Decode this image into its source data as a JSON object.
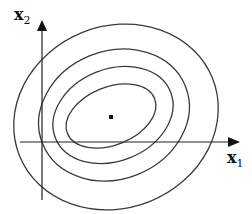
{
  "diagram": {
    "type": "contour-ellipses",
    "axes": {
      "x": {
        "label": "x",
        "subscript": "1"
      },
      "y": {
        "label": "x",
        "subscript": "2"
      }
    },
    "center_point": {
      "x": 111,
      "y": 117
    },
    "ellipses": [
      {
        "name": "contour-outer",
        "cx": 116,
        "cy": 117,
        "rx": 104,
        "ry": 91,
        "rotate": -22
      },
      {
        "name": "contour-2",
        "cx": 114,
        "cy": 115,
        "rx": 77,
        "ry": 64,
        "rotate": -22
      },
      {
        "name": "contour-3",
        "cx": 113,
        "cy": 115,
        "rx": 62,
        "ry": 46,
        "rotate": -22
      },
      {
        "name": "contour-inner",
        "cx": 111,
        "cy": 116,
        "rx": 47,
        "ry": 29,
        "rotate": -22
      }
    ],
    "colors": {
      "stroke": "#333333",
      "axis": "#222222",
      "background": "#ffffff"
    }
  }
}
